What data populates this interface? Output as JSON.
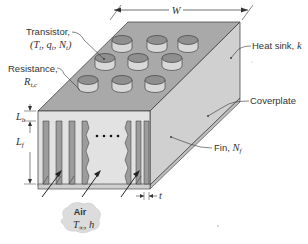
{
  "figure": {
    "labels": {
      "width": "W",
      "heat_sink": "Heat sink, k",
      "transistor_line1": "Transistor,",
      "transistor_line2": "(T_t, q_t, N_t)",
      "resistance_line1": "Resistance,",
      "resistance_line2": "R_t,c",
      "base_thickness": "L_b",
      "fin_length": "L_f",
      "coverplate": "Coverplate",
      "fin": "Fin, N_f",
      "fin_thickness": "t",
      "air": "Air",
      "air_conditions": "T_∞, h"
    },
    "transistor_count": 9,
    "flow_arrows": 3,
    "colors": {
      "top_face": "#a9a9a9",
      "side_face": "#d0d0d0",
      "front_face": "#e2e2e2",
      "fin": "#9c9c9c",
      "transistor_top": "#8f8f8f",
      "transistor_side": "#d8d8d8",
      "air_cloud": "#dcdcdc",
      "lines": "#333333"
    }
  }
}
